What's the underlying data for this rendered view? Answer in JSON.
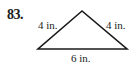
{
  "problem": {
    "number": "83."
  },
  "figure": {
    "shape": "isosceles-triangle",
    "stroke_color": "#1a1a1a",
    "vertices": {
      "apex": [
        82,
        11
      ],
      "left": [
        38,
        49
      ],
      "right": [
        127,
        49
      ]
    },
    "labels": {
      "left_side": "4 in.",
      "right_side": "4 in.",
      "base": "6 in."
    }
  }
}
